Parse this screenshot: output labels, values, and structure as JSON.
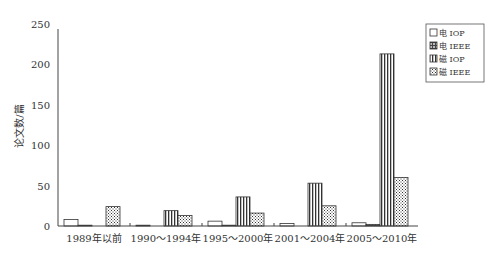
{
  "chart_data": {
    "type": "bar",
    "title": "",
    "xlabel": "",
    "ylabel": "论文数/篇",
    "ylim": [
      0,
      250
    ],
    "yticks": [
      0,
      50,
      100,
      150,
      200,
      250
    ],
    "grid": false,
    "legend_position": "top-right",
    "categories": [
      "1989年以前",
      "1990～1994年",
      "1995～2000年",
      "2001～2004年",
      "2005～2010年"
    ],
    "series": [
      {
        "name": "电 IOP",
        "pattern": "blank",
        "values": [
          8,
          1,
          6,
          3,
          4
        ]
      },
      {
        "name": "电 IEEE",
        "pattern": "grid",
        "values": [
          1,
          0,
          1,
          0,
          2
        ]
      },
      {
        "name": "磁 IOP",
        "pattern": "vertical-lines",
        "values": [
          0,
          19,
          36,
          53,
          213
        ]
      },
      {
        "name": "磁 IEEE",
        "pattern": "crosshatch",
        "values": [
          24,
          13,
          16,
          25,
          60
        ]
      }
    ]
  }
}
